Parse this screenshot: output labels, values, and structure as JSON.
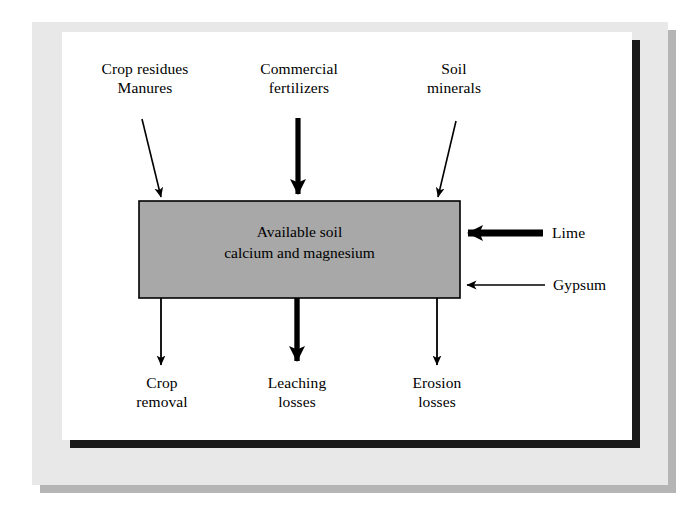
{
  "figure": {
    "center_box": {
      "text": "Available soil\ncalcium and magnesium",
      "fill_color": "#a8a8a8",
      "border_color": "#000000"
    },
    "inputs_top": [
      {
        "label": "Crop residues\nManures",
        "arrow": "thin-diagonal-down-right",
        "name": "crop-residues-manures"
      },
      {
        "label": "Commercial\nfertilizers",
        "arrow": "thick-down",
        "name": "commercial-fertilizers"
      },
      {
        "label": "Soil\nminerals",
        "arrow": "thin-diagonal-down-left",
        "name": "soil-minerals"
      }
    ],
    "inputs_right": [
      {
        "label": "Lime",
        "arrow": "thick-left",
        "name": "lime"
      },
      {
        "label": "Gypsum",
        "arrow": "thin-left",
        "name": "gypsum"
      }
    ],
    "outputs_bottom": [
      {
        "label": "Crop\nremoval",
        "arrow": "thin-down",
        "name": "crop-removal"
      },
      {
        "label": "Leaching\nlosses",
        "arrow": "thick-down",
        "name": "leaching-losses"
      },
      {
        "label": "Erosion\nlosses",
        "arrow": "thin-down",
        "name": "erosion-losses"
      }
    ],
    "colors": {
      "mat": "#e8e8e8",
      "mat_shadow": "#b5b5b5",
      "panel": "#ffffff",
      "panel_shadow": "#1a1a1a",
      "box_fill": "#a8a8a8",
      "ink": "#000000"
    }
  }
}
